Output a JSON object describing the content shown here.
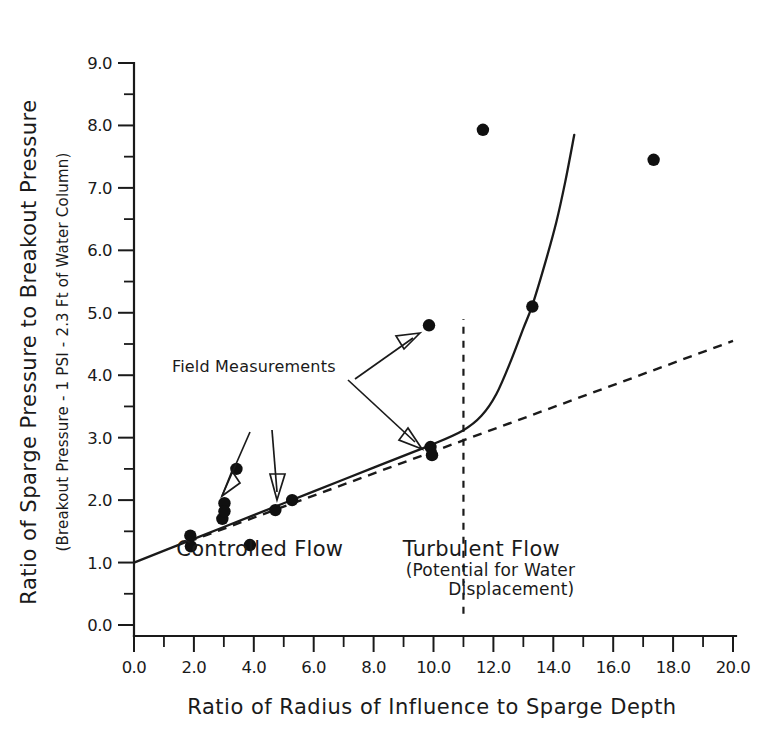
{
  "chart_data": {
    "type": "scatter",
    "title": "",
    "xlabel": "Ratio of Radius of Influence to Sparge Depth",
    "ylabel": "Ratio of Sparge Pressure to Breakout Pressure",
    "ylabel_sub": "(Breakout Pressure - 1 PSI - 2.3 Ft of Water Column)",
    "xlim": [
      0.0,
      20.0
    ],
    "ylim": [
      0.0,
      9.0
    ],
    "xticks": [
      0.0,
      2.0,
      4.0,
      6.0,
      8.0,
      10.0,
      12.0,
      14.0,
      16.0,
      18.0,
      20.0
    ],
    "xticklabels": [
      "0.0",
      "2.0",
      "4.0",
      "6.0",
      "8.0",
      "10.0",
      "12.0",
      "14.0",
      "16.0",
      "18.0",
      "20.0"
    ],
    "xtick_minor_step": 1.0,
    "yticks": [
      0.0,
      1.0,
      2.0,
      3.0,
      4.0,
      5.0,
      6.0,
      7.0,
      8.0,
      9.0
    ],
    "yticklabels": [
      "0.0",
      "1.0",
      "2.0",
      "3.0",
      "4.0",
      "5.0",
      "6.0",
      "7.0",
      "8.0",
      "9.0"
    ],
    "ytick_minor_step": 0.5,
    "grid": false,
    "legend": "none",
    "points": [
      {
        "x": 1.88,
        "y": 1.43
      },
      {
        "x": 1.9,
        "y": 1.26
      },
      {
        "x": 2.95,
        "y": 1.7
      },
      {
        "x": 3.02,
        "y": 1.95
      },
      {
        "x": 3.02,
        "y": 1.82
      },
      {
        "x": 3.42,
        "y": 2.5
      },
      {
        "x": 3.87,
        "y": 1.28
      },
      {
        "x": 4.72,
        "y": 1.84
      },
      {
        "x": 5.28,
        "y": 2.0
      },
      {
        "x": 9.85,
        "y": 4.8
      },
      {
        "x": 9.9,
        "y": 2.85
      },
      {
        "x": 9.95,
        "y": 2.72
      },
      {
        "x": 11.65,
        "y": 7.93
      },
      {
        "x": 13.3,
        "y": 5.1
      },
      {
        "x": 17.35,
        "y": 7.45
      }
    ],
    "fit_curve": {
      "name": "breakout-curve",
      "style": "solid",
      "points": [
        {
          "x": 0.0,
          "y": 1.0
        },
        {
          "x": 2.0,
          "y": 1.38
        },
        {
          "x": 4.0,
          "y": 1.76
        },
        {
          "x": 6.0,
          "y": 2.14
        },
        {
          "x": 8.0,
          "y": 2.52
        },
        {
          "x": 10.0,
          "y": 2.9
        },
        {
          "x": 11.0,
          "y": 3.12
        },
        {
          "x": 11.6,
          "y": 3.35
        },
        {
          "x": 12.1,
          "y": 3.7
        },
        {
          "x": 12.6,
          "y": 4.25
        },
        {
          "x": 13.0,
          "y": 4.75
        },
        {
          "x": 13.3,
          "y": 5.12
        },
        {
          "x": 13.7,
          "y": 5.75
        },
        {
          "x": 14.1,
          "y": 6.45
        },
        {
          "x": 14.4,
          "y": 7.1
        },
        {
          "x": 14.7,
          "y": 7.85
        }
      ]
    },
    "extrapolation_line": {
      "name": "linear-extrapolation",
      "style": "dashed",
      "points": [
        {
          "x": 1.8,
          "y": 1.33
        },
        {
          "x": 20.0,
          "y": 4.55
        }
      ]
    },
    "divider": {
      "name": "flow-regime-divider",
      "style": "dashed-vertical",
      "x": 11.0,
      "y_from": 0.18,
      "y_to": 4.9
    },
    "annotations": [
      {
        "name": "field-measurements",
        "text": "Field Measurements",
        "x": 4.0,
        "y": 4.05
      },
      {
        "name": "controlled-flow",
        "text": "Controlled Flow",
        "x": 4.2,
        "y": 1.1
      },
      {
        "name": "turbulent-flow",
        "text": "Turbulent Flow",
        "x": 11.6,
        "y": 1.1
      },
      {
        "name": "turbulent-flow-note-line1",
        "text": "(Potential for Water",
        "x": 11.9,
        "y": 0.78
      },
      {
        "name": "turbulent-flow-note-line2",
        "text": "Displacement)",
        "x": 12.6,
        "y": 0.48
      }
    ]
  },
  "axes": {
    "x_title": "Ratio of Radius of Influence to Sparge Depth",
    "y_title": "Ratio of Sparge Pressure to Breakout Pressure",
    "y_subtitle": "(Breakout Pressure - 1 PSI - 2.3 Ft of Water Column)"
  },
  "colors": {
    "ink": "#1a1a1a",
    "point": "#101010",
    "background": "#ffffff"
  }
}
